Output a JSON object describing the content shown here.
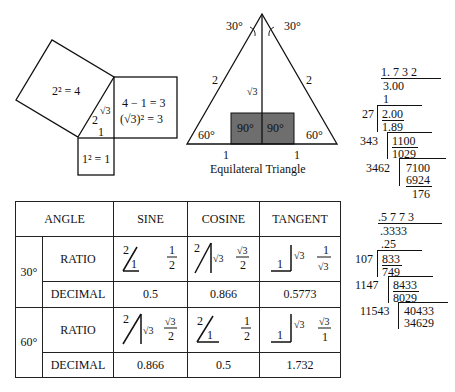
{
  "pythagoras": {
    "big_square": "2² = 4",
    "right_square_line1": "4 − 1 = 3",
    "right_square_line2": "(√3)² = 3",
    "small_square": "1² = 1",
    "hyp_label": "2",
    "leg_sqrt3": "√3",
    "leg_one": "1"
  },
  "equilateral": {
    "caption": "Equilateral Triangle",
    "top_left_angle": "30°",
    "top_right_angle": "30°",
    "left_side": "2",
    "right_side": "2",
    "height": "√3",
    "left_base_angle": "60°",
    "right_base_angle": "60°",
    "left_right_angle": "90°",
    "right_right_angle": "90°",
    "left_half_base": "1",
    "right_half_base": "1",
    "shade_color": "#6e6e6e"
  },
  "sqrt3_division": {
    "quotient": "1. 7 3 2",
    "radicand": "3.00",
    "first_sub": "1",
    "steps": [
      {
        "divisor": "27",
        "dividend": "2.00",
        "product": "1.89"
      },
      {
        "divisor": "343",
        "dividend": "1100",
        "product": "1029"
      },
      {
        "divisor": "3462",
        "dividend": "7100",
        "product": "6924"
      }
    ],
    "remainder": "176"
  },
  "inv_sqrt3_division": {
    "quotient": ".5 7 7 3",
    "radicand": ".3333",
    "first_sub": ".25",
    "steps": [
      {
        "divisor": "107",
        "dividend": "833",
        "product": "749"
      },
      {
        "divisor": "1147",
        "dividend": "8433",
        "product": "8029"
      },
      {
        "divisor": "11543",
        "dividend": "40433",
        "product": "34629"
      }
    ]
  },
  "table": {
    "headers": {
      "angle": "ANGLE",
      "sine": "SINE",
      "cosine": "COSINE",
      "tangent": "TANGENT"
    },
    "rows": [
      {
        "angle": "30°",
        "ratio_label": "RATIO",
        "decimal_label": "DECIMAL",
        "sine": {
          "hyp": "2",
          "side": "1",
          "num": "1",
          "den": "2",
          "decimal": "0.5"
        },
        "cosine": {
          "hyp": "2",
          "side": "√3",
          "num": "√3",
          "den": "2",
          "decimal": "0.866"
        },
        "tangent": {
          "opp": "√3",
          "adj": "1",
          "num": "1",
          "den": "√3",
          "decimal": "0.5773"
        }
      },
      {
        "angle": "60°",
        "ratio_label": "RATIO",
        "decimal_label": "DECIMAL",
        "sine": {
          "hyp": "2",
          "side": "√3",
          "num": "√3",
          "den": "2",
          "decimal": "0.866"
        },
        "cosine": {
          "hyp": "2",
          "side": "1",
          "num": "1",
          "den": "2",
          "decimal": "0.5"
        },
        "tangent": {
          "opp": "√3",
          "adj": "1",
          "num": "√3",
          "den": "1",
          "decimal": "1.732"
        }
      }
    ]
  }
}
